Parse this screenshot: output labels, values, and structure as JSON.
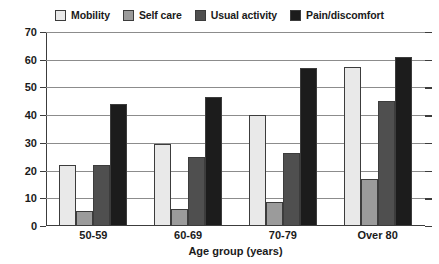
{
  "chart_data": {
    "type": "bar",
    "title": "",
    "xlabel": "Age group (years)",
    "ylabel": "Percentage reporting problem",
    "categories": [
      "50-59",
      "60-69",
      "70-79",
      "Over 80"
    ],
    "series": [
      {
        "name": "Mobility",
        "color": "#e9e9e9",
        "values": [
          22,
          29.5,
          40,
          57.5
        ]
      },
      {
        "name": "Self care",
        "color": "#9b9b9b",
        "values": [
          5.5,
          6,
          8.5,
          17
        ]
      },
      {
        "name": "Usual activity",
        "color": "#4f4f4f",
        "values": [
          22,
          25,
          26.5,
          45
        ]
      },
      {
        "name": "Pain/discomfort",
        "color": "#1c1c1c",
        "values": [
          44,
          46.5,
          57,
          61
        ]
      }
    ],
    "ylim": [
      0,
      70
    ],
    "yticks": [
      0,
      10,
      20,
      30,
      40,
      50,
      60,
      70
    ],
    "grid": true,
    "legend_position": "top"
  },
  "style": {
    "axis_color": "#3c3c3c",
    "grid_color": "#8c8c8c",
    "background": "#ffffff"
  }
}
